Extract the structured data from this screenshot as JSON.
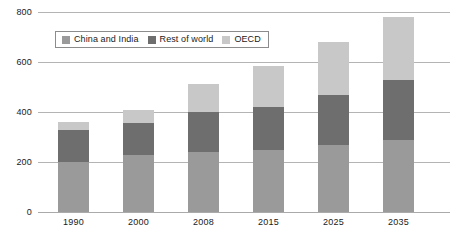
{
  "chart_data": {
    "type": "bar",
    "subtype": "stacked-vertical",
    "title": "",
    "subtitle": "",
    "xlabel": "",
    "ylabel": "",
    "categories": [
      "1990",
      "2000",
      "2008",
      "2015",
      "2025",
      "2035"
    ],
    "series": [
      {
        "name": "China and India",
        "color": "#9a9a9a",
        "values": [
          200,
          228,
          240,
          248,
          268,
          288
        ]
      },
      {
        "name": "Rest of world",
        "color": "#6e6e6e",
        "values": [
          128,
          128,
          160,
          172,
          200,
          240
        ]
      },
      {
        "name": "OECD",
        "color": "#c8c8c8",
        "values": [
          32,
          52,
          112,
          164,
          212,
          252
        ]
      }
    ],
    "totals": [
      360,
      408,
      512,
      584,
      680,
      780
    ],
    "ylim": [
      0,
      800
    ],
    "yticks": [
      0,
      200,
      400,
      600,
      800
    ],
    "ytick_labels": [
      "0",
      "200",
      "400",
      "600",
      "800"
    ],
    "grid": true,
    "grid_axis": "y",
    "legend_position": "inside-top-left",
    "annotations": []
  },
  "legend": {
    "items": [
      {
        "label": "China and India",
        "color": "#9a9a9a"
      },
      {
        "label": "Rest of world",
        "color": "#6e6e6e"
      },
      {
        "label": "OECD",
        "color": "#c8c8c8"
      }
    ]
  },
  "axis": {
    "y_labels": [
      "800",
      "600",
      "400",
      "200",
      "0"
    ],
    "x_labels": [
      "1990",
      "2000",
      "2008",
      "2015",
      "2025",
      "2035"
    ]
  }
}
